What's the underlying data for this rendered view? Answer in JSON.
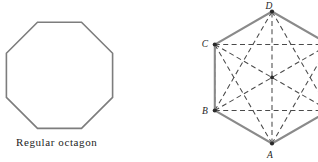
{
  "figure": {
    "background_color": "#ffffff",
    "width": 318,
    "height": 162,
    "panels": [
      {
        "id": "octagon-panel",
        "caption": "Regular octagon",
        "shape": "regular octagon",
        "sides": 8,
        "stroke_color": "#7d7d7d",
        "fill": "none",
        "center": [
          59.5,
          77
        ],
        "circumradius": 57.5,
        "rotation_deg": 22.5,
        "caption_position": [
          16,
          136
        ]
      },
      {
        "id": "hexagon-panel",
        "shape": "regular hexagon with all diagonals",
        "sides": 6,
        "stroke_color": "#8a8a8a",
        "diagonal_color": "#4a4a4a",
        "diagonal_style": "dashed",
        "diagonal_count": 9,
        "center": [
          272,
          77.5
        ],
        "circumradius": 66,
        "rotation_deg": 30,
        "clipped_at_right_edge": true,
        "vertices": [
          {
            "label": "A",
            "x": 272,
            "y": 143.5,
            "label_x": 270,
            "label_y": 157,
            "labeled": true
          },
          {
            "label": "",
            "x": 329.2,
            "y": 110.5,
            "label_x": 0,
            "label_y": 0,
            "labeled": false
          },
          {
            "label": "",
            "x": 329.2,
            "y": 44.5,
            "label_x": 0,
            "label_y": 0,
            "labeled": false
          },
          {
            "label": "D",
            "x": 272,
            "y": 11.5,
            "label_x": 269,
            "label_y": 9,
            "labeled": true
          },
          {
            "label": "C",
            "x": 214.8,
            "y": 44.5,
            "label_x": 203,
            "label_y": 47,
            "labeled": true
          },
          {
            "label": "B",
            "x": 214.8,
            "y": 110.5,
            "label_x": 203,
            "label_y": 113,
            "labeled": true
          }
        ],
        "center_dot": {
          "x": 272,
          "y": 77.5
        }
      }
    ]
  },
  "labels": {
    "octagon_caption": "Regular octagon",
    "vertex_a": "A",
    "vertex_b": "B",
    "vertex_c": "C",
    "vertex_d": "D"
  }
}
